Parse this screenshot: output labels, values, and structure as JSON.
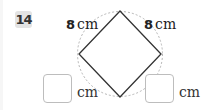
{
  "problem": {
    "number": "14",
    "figure": {
      "shape": "square-inscribed-in-circle",
      "side_labels": [
        {
          "position": "top-left",
          "value": "8",
          "unit": "cm"
        },
        {
          "position": "top-right",
          "value": "8",
          "unit": "cm"
        }
      ]
    },
    "answers": [
      {
        "position": "bottom-left",
        "value": "",
        "unit": "cm"
      },
      {
        "position": "bottom-right",
        "value": "",
        "unit": "cm"
      }
    ]
  },
  "colors": {
    "line": "#333333",
    "circle": "#b5b5b5",
    "badge_bg": "#e3e3e3",
    "box_border": "#bdbdbd"
  }
}
